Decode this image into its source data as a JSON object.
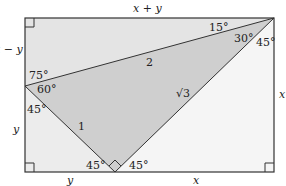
{
  "diagram": {
    "type": "geometry-proof",
    "colors": {
      "rect_fill": "#e4e4e4",
      "shaded_triangle": "#cfcfcf",
      "lower_left_triangle": "#ececec",
      "lower_right_triangle": "#f5f5f5",
      "stroke": "#333333"
    },
    "side_labels": {
      "top": "x + y",
      "left_upper": "x − y",
      "left_lower": "y",
      "bottom_left": "y",
      "bottom_right": "x",
      "right": "x"
    },
    "segment_labels": {
      "hypotenuse_top": "2",
      "left_leg": "1",
      "right_leg": "√3"
    },
    "angle_labels": {
      "top_right_upper": "15°",
      "top_right_middle": "30°",
      "top_right_lower": "45°",
      "left_upper": "75°",
      "left_middle": "60°",
      "left_lower": "45°",
      "bottom_left": "45°",
      "bottom_right": "45°"
    }
  }
}
